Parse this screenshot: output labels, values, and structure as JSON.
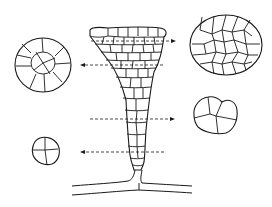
{
  "figure": {
    "type": "botanical-anatomy-diagram",
    "stroke_color": "#1a1a1a",
    "background": "#ffffff",
    "sections": [
      {
        "id": "section-top",
        "level": "upper",
        "arrow_direction": "right",
        "arrow_y": 41,
        "cells": "many"
      },
      {
        "id": "section-upper-mid",
        "level": "upper-middle",
        "arrow_direction": "left",
        "arrow_y": 65,
        "cells": "ring of ~14 around central cells"
      },
      {
        "id": "section-lower-mid",
        "level": "lower-middle",
        "arrow_direction": "right",
        "arrow_y": 119,
        "cells": 4
      },
      {
        "id": "section-bottom",
        "level": "lower",
        "arrow_direction": "left",
        "arrow_y": 152,
        "cells": 3
      }
    ]
  }
}
